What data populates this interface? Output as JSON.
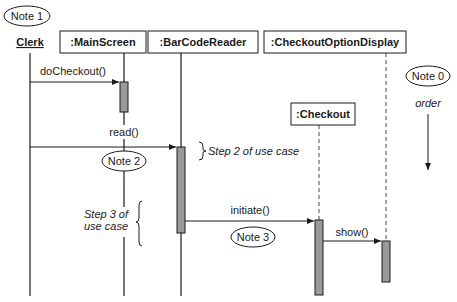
{
  "diagram": {
    "type": "uml-sequence",
    "actor": {
      "label": "Clerk"
    },
    "objects": [
      {
        "id": "mainscreen",
        "label": ":MainScreen"
      },
      {
        "id": "barcodereader",
        "label": ":BarCodeReader"
      },
      {
        "id": "checkoutoptiondisplay",
        "label": ":CheckoutOptionDisplay"
      },
      {
        "id": "checkout",
        "label": ":Checkout"
      }
    ],
    "messages": [
      {
        "label": "doCheckout()",
        "from": "Clerk",
        "to": ":MainScreen"
      },
      {
        "label": "read()",
        "from": "Clerk",
        "to": ":BarCodeReader"
      },
      {
        "label": "initiate()",
        "from": ":BarCodeReader",
        "to": ":Checkout"
      },
      {
        "label": "show()",
        "from": ":Checkout",
        "to": ":CheckoutOptionDisplay"
      }
    ],
    "notes": {
      "note0": "Note 0",
      "note1": "Note 1",
      "note2": "Note 2",
      "note3": "Note 3"
    },
    "annotations": {
      "order": "order",
      "step2": "Step 2 of use case",
      "step3_line1": "Step 3 of",
      "step3_line2": "use case"
    },
    "colors": {
      "line": "#1a1a1a",
      "activation_fill": "#9a9a9a",
      "background": "#ffffff"
    }
  }
}
